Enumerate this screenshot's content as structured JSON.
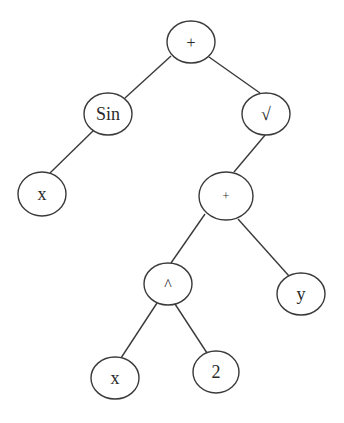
{
  "diagram": {
    "type": "expression-tree",
    "background": "#ffffff",
    "stroke_color": "#3a3a3a",
    "text_color": "#2a2a2a",
    "nodes": [
      {
        "id": "root_plus",
        "label": "+",
        "cx": 191,
        "cy": 42,
        "rx": 24,
        "ry": 21,
        "font_size": 16
      },
      {
        "id": "sin",
        "label": "Sin",
        "cx": 108,
        "cy": 114,
        "rx": 24,
        "ry": 21,
        "font_size": 18
      },
      {
        "id": "sqrt",
        "label": "√",
        "cx": 266,
        "cy": 114,
        "rx": 24,
        "ry": 21,
        "font_size": 18
      },
      {
        "id": "x_left",
        "label": "x",
        "cx": 42,
        "cy": 194,
        "rx": 24,
        "ry": 22,
        "font_size": 18
      },
      {
        "id": "inner_plus",
        "label": "+",
        "cx": 226,
        "cy": 196,
        "rx": 27,
        "ry": 24,
        "font_size": 12
      },
      {
        "id": "pow",
        "label": "^",
        "cx": 168,
        "cy": 284,
        "rx": 24,
        "ry": 21,
        "font_size": 16
      },
      {
        "id": "y",
        "label": "y",
        "cx": 301,
        "cy": 294,
        "rx": 24,
        "ry": 21,
        "font_size": 18
      },
      {
        "id": "x_bottom",
        "label": "x",
        "cx": 115,
        "cy": 378,
        "rx": 24,
        "ry": 21,
        "font_size": 18
      },
      {
        "id": "two",
        "label": "2",
        "cx": 216,
        "cy": 372,
        "rx": 23,
        "ry": 21,
        "font_size": 18
      }
    ],
    "edges": [
      {
        "from": "root_plus",
        "to": "sin",
        "x1": 171,
        "y1": 56,
        "x2": 125,
        "y2": 98
      },
      {
        "from": "root_plus",
        "to": "sqrt",
        "x1": 209,
        "y1": 57,
        "x2": 260,
        "y2": 93
      },
      {
        "from": "sin",
        "to": "x_left",
        "x1": 94,
        "y1": 130,
        "x2": 50,
        "y2": 173
      },
      {
        "from": "sqrt",
        "to": "inner_plus",
        "x1": 266,
        "y1": 134,
        "x2": 234,
        "y2": 172
      },
      {
        "from": "inner_plus",
        "to": "pow",
        "x1": 205,
        "y1": 214,
        "x2": 171,
        "y2": 263
      },
      {
        "from": "inner_plus",
        "to": "y",
        "x1": 238,
        "y1": 219,
        "x2": 289,
        "y2": 276
      },
      {
        "from": "pow",
        "to": "x_bottom",
        "x1": 157,
        "y1": 303,
        "x2": 121,
        "y2": 358
      },
      {
        "from": "pow",
        "to": "two",
        "x1": 175,
        "y1": 304,
        "x2": 207,
        "y2": 353
      }
    ],
    "expression": "Sin(x) + √(x^2 + y)"
  }
}
